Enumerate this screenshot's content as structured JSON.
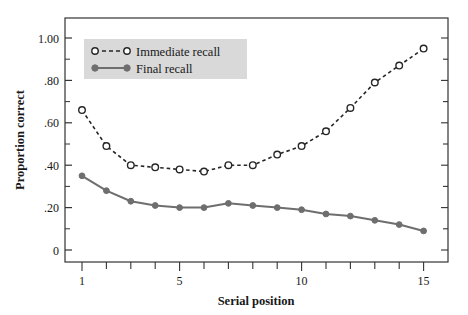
{
  "chart_data": {
    "type": "line",
    "title": "",
    "xlabel": "Serial position",
    "ylabel": "Proportion correct",
    "xlim": [
      0.45,
      15.6
    ],
    "ylim": [
      0,
      1.08
    ],
    "grid": false,
    "legend_position": "top-left",
    "x": [
      1,
      2,
      3,
      4,
      5,
      6,
      7,
      8,
      9,
      10,
      11,
      12,
      13,
      14,
      15
    ],
    "xticks": [
      1,
      5,
      10,
      15
    ],
    "xtick_labels": [
      "1",
      "5",
      "10",
      "15"
    ],
    "xminor_ticks": [
      1,
      2,
      3,
      4,
      5,
      6,
      7,
      8,
      9,
      10,
      11,
      12,
      13,
      14,
      15
    ],
    "yticks": [
      0,
      0.2,
      0.4,
      0.6,
      0.8,
      1.0
    ],
    "ytick_labels": [
      "0",
      ".20",
      ".40",
      ".60",
      ".80",
      "1.00"
    ],
    "yminor_ticks": [
      0.1,
      0.3,
      0.5,
      0.7,
      0.9
    ],
    "series": [
      {
        "name": "Immediate recall",
        "marker": "open-circle",
        "linestyle": "dashed",
        "color": "#262626",
        "values": [
          0.66,
          0.49,
          0.4,
          0.39,
          0.38,
          0.37,
          0.4,
          0.4,
          0.45,
          0.49,
          0.56,
          0.67,
          0.79,
          0.87,
          0.95
        ]
      },
      {
        "name": "Final recall",
        "marker": "filled-circle",
        "linestyle": "solid",
        "color": "#6e6e6e",
        "values": [
          0.35,
          0.28,
          0.23,
          0.21,
          0.2,
          0.2,
          0.22,
          0.21,
          0.2,
          0.19,
          0.17,
          0.16,
          0.14,
          0.12,
          0.09
        ]
      }
    ]
  },
  "legend": {
    "background": "#d9d9d9",
    "items": [
      {
        "label": "Immediate recall"
      },
      {
        "label": "Final recall"
      }
    ]
  },
  "axes": {
    "xlabel": "Serial position",
    "ylabel": "Proportion correct",
    "frame_color": "#333333"
  }
}
